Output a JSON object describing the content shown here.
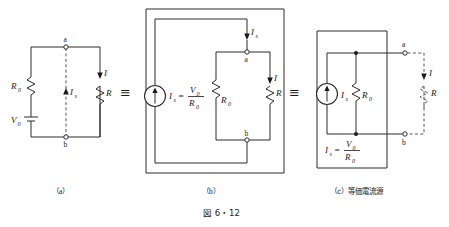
{
  "figure": {
    "number": "図 6・12",
    "panels": [
      {
        "id": "a",
        "caption": "（a）",
        "labels": {
          "node_a": "a",
          "node_b": "b",
          "resistor_internal": "R",
          "resistor_internal_sub": "0",
          "source_voltage": "V",
          "source_voltage_sub": "0",
          "current_short": "I",
          "current_short_sub": "s",
          "current_load": "I",
          "resistor_load": "R"
        }
      },
      {
        "id": "b",
        "caption": "（b）",
        "labels": {
          "node_a": "a",
          "node_b": "b",
          "source_current": "I",
          "source_current_sub": "s",
          "equals": "=",
          "numerator": "V",
          "numerator_sub": "0",
          "denominator": "R",
          "denominator_sub": "0",
          "resistor_internal": "R",
          "resistor_internal_sub": "0",
          "injected_current": "I",
          "injected_current_sub": "s",
          "current_load": "I",
          "resistor_load": "R"
        }
      },
      {
        "id": "c",
        "caption": "（c）等価電流源",
        "caption_prefix": "（c）",
        "caption_text": "等価電流源",
        "labels": {
          "node_a": "a",
          "node_b": "b",
          "source_current": "I",
          "source_current_sub": "s",
          "resistor_internal": "R",
          "resistor_internal_sub": "0",
          "current_load": "I",
          "resistor_load": "R",
          "formula_lhs": "I",
          "formula_lhs_sub": "s",
          "formula_equals": "=",
          "formula_numerator": "V",
          "formula_numerator_sub": "0",
          "formula_denominator": "R",
          "formula_denominator_sub": "0"
        }
      }
    ],
    "equivalence_symbols": [
      "≡",
      "≡"
    ]
  },
  "colors": {
    "wire": "#2b2b2b",
    "dashed_wire": "#555555",
    "text": "#1a1a1a",
    "background": "#ffffff"
  }
}
